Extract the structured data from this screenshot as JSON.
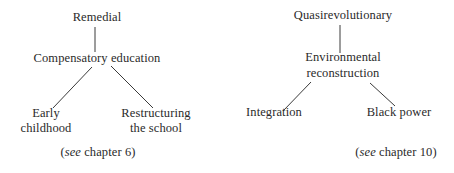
{
  "left_tree": {
    "root": "Remedial",
    "middle": "Compensatory education",
    "leaf_left": [
      "Early",
      "childhood"
    ],
    "leaf_right": [
      "Restructuring",
      "the school"
    ],
    "reference": {
      "prefix": "(",
      "see": "see",
      "suffix": " chapter 6)"
    }
  },
  "right_tree": {
    "root": "Quasirevolutionary",
    "middle": [
      "Environmental",
      "reconstruction"
    ],
    "leaf_left": "Integration",
    "leaf_right": "Black power",
    "reference": {
      "prefix": "(",
      "see": "see",
      "suffix": " chapter 10)"
    }
  },
  "colors": {
    "text": "#2a2a2a",
    "lines": "#3a3a3a",
    "background": "#ffffff"
  }
}
